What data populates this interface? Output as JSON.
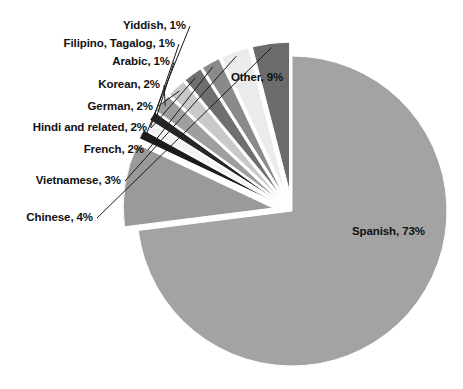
{
  "chart_data": {
    "type": "pie",
    "title": "",
    "subtitle": "",
    "xlabel": "",
    "ylabel": "",
    "legend_position": "none",
    "grid": false,
    "label_format": "{name}, {value}%",
    "units": "percent",
    "total": 100,
    "start_angle_deg": 0,
    "direction": "clockwise",
    "categories": [
      "Spanish",
      "Other",
      "Yiddish",
      "Filipino, Tagalog",
      "Arabic",
      "Korean",
      "German",
      "Hindi and related",
      "French",
      "Vietnamese",
      "Chinese"
    ],
    "values": [
      73,
      9,
      1,
      1,
      1,
      2,
      2,
      2,
      2,
      3,
      4
    ],
    "colors": [
      "#a3a3a3",
      "#9a9a9a",
      "#1c1c1c",
      "#f2f2f2",
      "#262626",
      "#9e9e9e",
      "#c9c9c9",
      "#6f6f6f",
      "#8a8a8a",
      "#ebebeb",
      "#6b6b6b"
    ],
    "slices": [
      {
        "name": "Spanish",
        "value": 73,
        "label": "Spanish, 73%",
        "color": "#a3a3a3",
        "exploded": false,
        "label_placement": "inside"
      },
      {
        "name": "Other",
        "value": 9,
        "label": "Other, 9%",
        "color": "#9a9a9a",
        "exploded": true,
        "label_placement": "inside"
      },
      {
        "name": "Yiddish",
        "value": 1,
        "label": "Yiddish, 1%",
        "color": "#1c1c1c",
        "exploded": true,
        "label_placement": "outside-left"
      },
      {
        "name": "Filipino, Tagalog",
        "value": 1,
        "label": "Filipino, Tagalog, 1%",
        "color": "#f2f2f2",
        "exploded": true,
        "label_placement": "outside-left"
      },
      {
        "name": "Arabic",
        "value": 1,
        "label": "Arabic, 1%",
        "color": "#262626",
        "exploded": true,
        "label_placement": "outside-left"
      },
      {
        "name": "Korean",
        "value": 2,
        "label": "Korean, 2%",
        "color": "#9e9e9e",
        "exploded": true,
        "label_placement": "outside-left"
      },
      {
        "name": "German",
        "value": 2,
        "label": "German, 2%",
        "color": "#c9c9c9",
        "exploded": true,
        "label_placement": "outside-left"
      },
      {
        "name": "Hindi and related",
        "value": 2,
        "label": "Hindi and related, 2%",
        "color": "#6f6f6f",
        "exploded": true,
        "label_placement": "outside-left"
      },
      {
        "name": "French",
        "value": 2,
        "label": "French, 2%",
        "color": "#8a8a8a",
        "exploded": true,
        "label_placement": "outside-left"
      },
      {
        "name": "Vietnamese",
        "value": 3,
        "label": "Vietnamese, 3%",
        "color": "#ebebeb",
        "exploded": true,
        "label_placement": "outside-left"
      },
      {
        "name": "Chinese",
        "value": 4,
        "label": "Chinese, 4%",
        "color": "#6b6b6b",
        "exploded": true,
        "label_placement": "outside-left"
      }
    ]
  },
  "labels": {
    "spanish": "Spanish, 73%",
    "other": "Other, 9%",
    "yiddish": "Yiddish, 1%",
    "filipino": "Filipino, Tagalog, 1%",
    "arabic": "Arabic, 1%",
    "korean": "Korean, 2%",
    "german": "German, 2%",
    "hindi": "Hindi and related, 2%",
    "french": "French, 2%",
    "vietnamese": "Vietnamese, 3%",
    "chinese": "Chinese, 4%"
  },
  "style": {
    "background": "#ffffff",
    "label_color": "#111111",
    "leader_color": "#1a1a1a"
  }
}
